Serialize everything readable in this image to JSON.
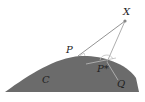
{
  "diagram": {
    "labels": {
      "x": "X",
      "p": "P",
      "pstar": "P*",
      "q": "Q",
      "c": "C"
    },
    "colors": {
      "region": "#6b6b6b",
      "lines": "#777777",
      "light_lines": "#bdbdbd",
      "point": "#888888",
      "text": "#222222"
    }
  }
}
